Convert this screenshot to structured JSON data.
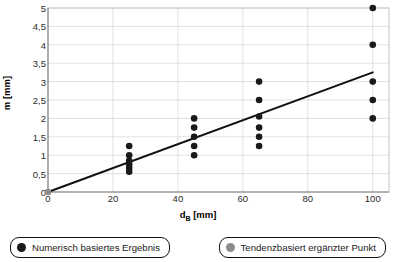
{
  "chart_data": {
    "type": "scatter",
    "title": "",
    "xlabel": "d_B [mm]",
    "xlabel_main": "d",
    "xlabel_sub": "B",
    "xlabel_unit": " [mm]",
    "ylabel": "m [mm]",
    "xlim": [
      0,
      105
    ],
    "ylim": [
      0,
      5
    ],
    "xticks": [
      0,
      20,
      40,
      60,
      80,
      100
    ],
    "xtick_labels": [
      "0",
      "20",
      "40",
      "60",
      "80",
      "100"
    ],
    "yticks": [
      0,
      0.5,
      1,
      1.5,
      2,
      2.5,
      3,
      3.5,
      4,
      4.5,
      5
    ],
    "ytick_labels": [
      "0",
      "0,5",
      "1",
      "1,5",
      "2",
      "2,5",
      "3",
      "3,5",
      "4",
      "4,5",
      "5"
    ],
    "grid": true,
    "grid_color": "#d9d9d9",
    "legend_position": "below",
    "series": [
      {
        "name": "Numerisch basiertes Ergebnis",
        "marker": "circle",
        "color": "#1a1a1a",
        "points": [
          {
            "x": 25,
            "y": 1.25
          },
          {
            "x": 25,
            "y": 1.0
          },
          {
            "x": 25,
            "y": 0.85
          },
          {
            "x": 25,
            "y": 0.75
          },
          {
            "x": 25,
            "y": 0.65
          },
          {
            "x": 25,
            "y": 0.55
          },
          {
            "x": 45,
            "y": 2.0
          },
          {
            "x": 45,
            "y": 1.75
          },
          {
            "x": 45,
            "y": 1.5
          },
          {
            "x": 45,
            "y": 1.25
          },
          {
            "x": 45,
            "y": 1.0
          },
          {
            "x": 65,
            "y": 3.0
          },
          {
            "x": 65,
            "y": 2.5
          },
          {
            "x": 65,
            "y": 2.05
          },
          {
            "x": 65,
            "y": 1.75
          },
          {
            "x": 65,
            "y": 1.5
          },
          {
            "x": 65,
            "y": 1.25
          },
          {
            "x": 100,
            "y": 5.0
          },
          {
            "x": 100,
            "y": 4.0
          },
          {
            "x": 100,
            "y": 3.0
          },
          {
            "x": 100,
            "y": 2.5
          },
          {
            "x": 100,
            "y": 2.0
          }
        ]
      },
      {
        "name": "Tendenzbasiert ergänzter Punkt",
        "marker": "circle",
        "color": "#8c8c8c",
        "points": [
          {
            "x": 0,
            "y": 0
          }
        ]
      }
    ],
    "trendline": {
      "type": "line",
      "color": "#111111",
      "x_start": 0,
      "y_start": 0,
      "x_end": 100,
      "y_end": 3.25,
      "slope": 0.0325,
      "intercept": 0
    }
  },
  "legend": {
    "items": [
      {
        "label": "Numerisch basiertes Ergebnis",
        "color": "#1a1a1a"
      },
      {
        "label": "Tendenzbasiert ergänzter Punkt",
        "color": "#8c8c8c"
      }
    ]
  }
}
